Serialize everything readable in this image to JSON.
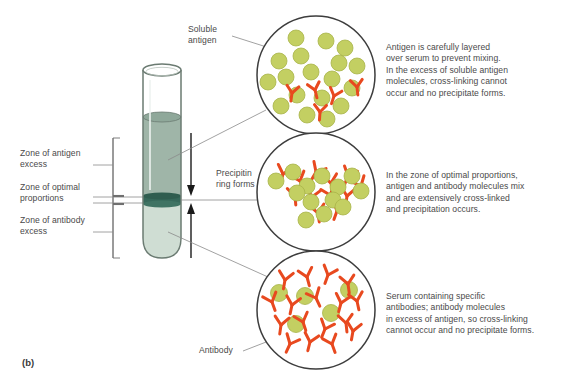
{
  "figure": {
    "panel_tag": "(b)",
    "background_color": "#ffffff"
  },
  "colors": {
    "antigen_fill": "#c3cf62",
    "antigen_stroke": "#a8b449",
    "antibody": "#e8491f",
    "tube_outline": "#6b7b72",
    "tube_upper_layer": "#9fb5a8",
    "tube_band": "#36685a",
    "tube_lower_layer": "#cfddd3",
    "circle_outline": "#3d3d3d",
    "leader_line": "#8a8a8a",
    "text": "#4a4a4a"
  },
  "zone_labels": [
    {
      "id": "antigen-excess",
      "text": "Zone of antigen\nexcess"
    },
    {
      "id": "optimal-proportions",
      "text": "Zone of optimal\nproportions"
    },
    {
      "id": "antibody-excess",
      "text": "Zone of antibody\nexcess"
    }
  ],
  "callouts": [
    {
      "id": "soluble-antigen",
      "text": "Soluble\nantigen"
    },
    {
      "id": "precipitin-ring",
      "text": "Precipitin\nring forms"
    },
    {
      "id": "antibody",
      "text": "Antibody"
    }
  ],
  "descriptions": [
    {
      "id": "antigen-excess-description",
      "text": "Antigen is carefully layered\nover serum to prevent mixing.\nIn the excess of soluble antigen\nmolecules, cross-linking cannot\noccur and no precipitate forms."
    },
    {
      "id": "optimal-proportions-description",
      "text": "In the zone of optimal proportions,\nantigen and antibody molecules mix\nand are extensively cross-linked\nand precipitation occurs."
    },
    {
      "id": "antibody-excess-description",
      "text": "Serum containing specific\nantibodies; antibody molecules\nin excess of antigen, so cross-linking\ncannot occur and no precipitate forms."
    }
  ],
  "tube": {
    "name": "test-tube",
    "layers": [
      {
        "id": "antigen-layer",
        "label": "soluble antigen solution"
      },
      {
        "id": "precipitin-band",
        "label": "precipitin ring"
      },
      {
        "id": "serum-layer",
        "label": "antibody serum"
      }
    ],
    "arrows": [
      {
        "id": "antigen-diffusion-arrow",
        "direction": "down"
      },
      {
        "id": "antibody-diffusion-arrow",
        "direction": "up"
      }
    ]
  },
  "circles": [
    {
      "id": "antigen-excess-detail",
      "cx": 316,
      "cy": 75,
      "r": 59,
      "antigens": [
        [
          296,
          38
        ],
        [
          326,
          41
        ],
        [
          345,
          48
        ],
        [
          301,
          56
        ],
        [
          279,
          61
        ],
        [
          339,
          63
        ],
        [
          356,
          66
        ],
        [
          286,
          77
        ],
        [
          311,
          72
        ],
        [
          332,
          79
        ],
        [
          268,
          82
        ],
        [
          352,
          88
        ],
        [
          297,
          95
        ],
        [
          322,
          98
        ],
        [
          281,
          106
        ],
        [
          341,
          106
        ],
        [
          307,
          115
        ],
        [
          327,
          119
        ]
      ],
      "antibodies": [
        {
          "x": 292,
          "y": 93,
          "rot": 8
        },
        {
          "x": 315,
          "y": 90,
          "rot": -14
        },
        {
          "x": 333,
          "y": 95,
          "rot": 18
        },
        {
          "x": 356,
          "y": 87,
          "rot": -6
        },
        {
          "x": 320,
          "y": 112,
          "rot": 4
        }
      ]
    },
    {
      "id": "optimal-proportions-detail",
      "cx": 316,
      "cy": 192,
      "r": 59,
      "antigens": [
        [
          276,
          180
        ],
        [
          293,
          172
        ],
        [
          307,
          186
        ],
        [
          322,
          176
        ],
        [
          338,
          187
        ],
        [
          352,
          176
        ],
        [
          360,
          190
        ],
        [
          333,
          199
        ],
        [
          311,
          201
        ],
        [
          297,
          193
        ],
        [
          324,
          213
        ],
        [
          342,
          207
        ],
        [
          306,
          219
        ],
        [
          285,
          189
        ]
      ],
      "antibodies": [
        {
          "x": 283,
          "y": 174,
          "rot": 15
        },
        {
          "x": 300,
          "y": 180,
          "rot": -20
        },
        {
          "x": 316,
          "y": 172,
          "rot": 30
        },
        {
          "x": 331,
          "y": 182,
          "rot": -10
        },
        {
          "x": 348,
          "y": 176,
          "rot": 22
        },
        {
          "x": 360,
          "y": 185,
          "rot": -25
        },
        {
          "x": 295,
          "y": 196,
          "rot": -5
        },
        {
          "x": 312,
          "y": 196,
          "rot": 12
        },
        {
          "x": 330,
          "y": 194,
          "rot": -18
        },
        {
          "x": 346,
          "y": 196,
          "rot": 8
        },
        {
          "x": 318,
          "y": 212,
          "rot": -8
        },
        {
          "x": 336,
          "y": 210,
          "rot": 20
        }
      ]
    },
    {
      "id": "antibody-excess-detail",
      "cx": 316,
      "cy": 310,
      "r": 59,
      "antigens": [
        [
          279,
          293
        ],
        [
          305,
          296
        ],
        [
          330,
          313
        ],
        [
          296,
          324
        ],
        [
          339,
          288
        ]
      ],
      "antibodies": [
        {
          "x": 285,
          "y": 280,
          "rot": 10
        },
        {
          "x": 307,
          "y": 276,
          "rot": -15
        },
        {
          "x": 328,
          "y": 274,
          "rot": 20
        },
        {
          "x": 348,
          "y": 283,
          "rot": -8
        },
        {
          "x": 272,
          "y": 300,
          "rot": -20
        },
        {
          "x": 292,
          "y": 304,
          "rot": 12
        },
        {
          "x": 316,
          "y": 297,
          "rot": -25
        },
        {
          "x": 340,
          "y": 302,
          "rot": 15
        },
        {
          "x": 356,
          "y": 300,
          "rot": -12
        },
        {
          "x": 281,
          "y": 324,
          "rot": 8
        },
        {
          "x": 303,
          "y": 321,
          "rot": -18
        },
        {
          "x": 324,
          "y": 328,
          "rot": 22
        },
        {
          "x": 345,
          "y": 322,
          "rot": -6
        },
        {
          "x": 310,
          "y": 341,
          "rot": 14
        },
        {
          "x": 332,
          "y": 343,
          "rot": -20
        },
        {
          "x": 290,
          "y": 343,
          "rot": 25
        },
        {
          "x": 352,
          "y": 330,
          "rot": 10
        }
      ]
    }
  ]
}
